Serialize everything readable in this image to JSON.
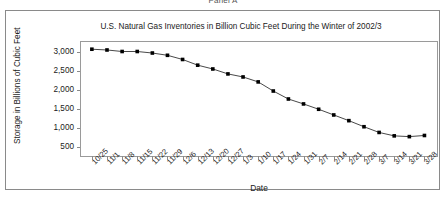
{
  "panel": {
    "label": "Panel A"
  },
  "axis": {
    "y_caption": "Storage in Billions of Cubic Feet",
    "x_caption": "Date"
  },
  "chart_data": {
    "type": "line",
    "title": "U.S. Natural Gas Inventories in Billion Cubic Feet During the Winter of 2002/3",
    "xlabel": "Date",
    "ylabel": "Storage in Billions of Cubic Feet",
    "ylim": [
      250,
      3250
    ],
    "yticks": [
      500,
      1000,
      1500,
      2000,
      2500,
      3000
    ],
    "ytick_labels": [
      "500",
      "1,000",
      "1,500",
      "2,000",
      "2,500",
      "3,000"
    ],
    "grid": false,
    "legend": "none",
    "marker": "square",
    "marker_color": "#000000",
    "line_color": "#333333",
    "categories": [
      "10/25",
      "11/1",
      "11/8",
      "11/15",
      "11/22",
      "11/29",
      "12/6",
      "12/13",
      "12/20",
      "12/27",
      "1/3",
      "1/10",
      "1/17",
      "1/24",
      "1/31",
      "2/7",
      "2/14",
      "2/21",
      "2/28",
      "3/7",
      "3/14",
      "3/21",
      "3/28"
    ],
    "values": [
      3060,
      3040,
      3000,
      3000,
      2960,
      2900,
      2790,
      2640,
      2540,
      2410,
      2330,
      2200,
      1960,
      1750,
      1620,
      1480,
      1330,
      1180,
      1020,
      870,
      780,
      760,
      790
    ]
  }
}
